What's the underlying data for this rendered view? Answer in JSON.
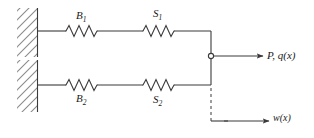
{
  "figure": {
    "name": "two-parallel-spring-chains-schematic",
    "stroke_color": "#3a3a3a",
    "hatch_color": "#808080",
    "background": "#ffffff"
  },
  "labels": {
    "spring_top_left": {
      "symbol": "B",
      "subscript": "1"
    },
    "spring_top_right": {
      "symbol": "S",
      "subscript": "1"
    },
    "spring_bottom_left": {
      "symbol": "B",
      "subscript": "2"
    },
    "spring_bottom_right": {
      "symbol": "S",
      "subscript": "2"
    },
    "load": "P, q(x)",
    "displacement": "w(x)"
  },
  "elements": {
    "wall_top": "fixed-support-hatched",
    "wall_bottom": "fixed-support-hatched",
    "pin_joint": "pin-hinge-circle",
    "rigid_bar": "vertical-rigid-bar",
    "load_arrow": "arrow-right",
    "displacement_arrow": "arrow-right",
    "datum_line": "dashed-vertical-reference"
  }
}
